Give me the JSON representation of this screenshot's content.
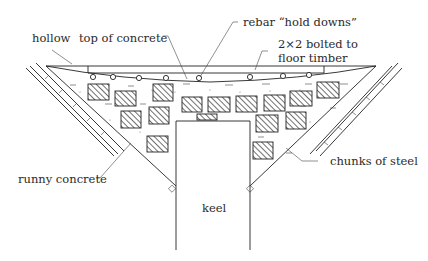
{
  "diagram": {
    "type": "cross-section",
    "labels": {
      "hollow": "hollow",
      "top_of_concrete": "top of concrete",
      "rebar": "rebar “hold downs”",
      "bolted_line1": "2×2 bolted to",
      "bolted_line2": "floor timber",
      "chunks": "chunks of steel",
      "runny": "runny concrete",
      "keel": "keel"
    },
    "colors": {
      "line": "#222222",
      "text": "#2a2a2a",
      "background": "#ffffff"
    },
    "rebar_count": 8,
    "steel_chunk_count": 16
  }
}
